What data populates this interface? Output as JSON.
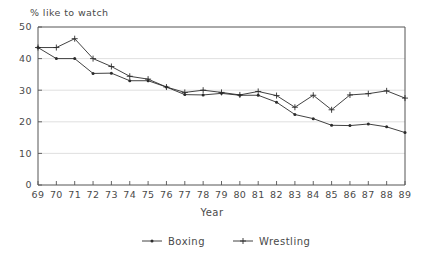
{
  "chart_data": {
    "type": "line",
    "title": "",
    "ylabel": "% like to watch",
    "xlabel": "Year",
    "categories": [
      "69",
      "70",
      "71",
      "72",
      "73",
      "74",
      "75",
      "76",
      "77",
      "78",
      "79",
      "80",
      "81",
      "82",
      "83",
      "84",
      "85",
      "86",
      "87",
      "88",
      "89"
    ],
    "ylim": [
      0,
      50
    ],
    "yticks": [
      0,
      10,
      20,
      30,
      40,
      50
    ],
    "grid": true,
    "grid_axis": "y",
    "legend_position": "bottom",
    "series": [
      {
        "name": "Boxing",
        "marker": "dot",
        "values": [
          43.5,
          40.0,
          40.0,
          35.3,
          35.4,
          33.0,
          33.0,
          31.0,
          28.6,
          28.5,
          29.0,
          28.4,
          28.4,
          26.2,
          22.3,
          21.0,
          18.9,
          18.8,
          19.3,
          18.4,
          16.6
        ]
      },
      {
        "name": "Wrestling",
        "marker": "plus",
        "values": [
          43.5,
          43.5,
          46.3,
          40.0,
          37.5,
          34.4,
          33.5,
          31.0,
          29.3,
          30.0,
          29.3,
          28.5,
          29.6,
          28.3,
          24.6,
          28.4,
          23.8,
          28.5,
          28.9,
          29.8,
          27.5
        ]
      }
    ]
  },
  "legend": {
    "items": [
      {
        "label": "Boxing"
      },
      {
        "label": "Wrestling"
      }
    ]
  }
}
